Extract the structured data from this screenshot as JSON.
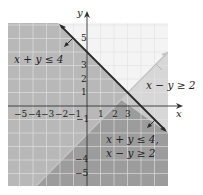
{
  "graph": {
    "axes": {
      "x_label": "x",
      "y_label": "y",
      "x_tick_labels": [
        "−5",
        "−4",
        "−3",
        "−2",
        "−1",
        "1",
        "2",
        "3"
      ],
      "y_tick_labels": [
        "5",
        "3",
        "2",
        "1",
        "−1",
        "−4",
        "−5"
      ]
    },
    "labels": {
      "region1": "x + y ≤ 4",
      "region2": "x − y ≥ 2",
      "solution_line1": "x + y ≤ 4,",
      "solution_line2": "x − y ≥ 2"
    },
    "lines": [
      {
        "equation": "x + y = 4",
        "style": "solid-dark"
      },
      {
        "equation": "x − y = 2",
        "style": "solid-light"
      }
    ],
    "colors": {
      "region1_shade": "#b3b3b3",
      "region2_shade": "#c9c9c9",
      "overlap_shade": "#9a9a9a",
      "grid": "#e6e6e6",
      "boundary_dark": "#2a2a2a",
      "boundary_light": "#bdbdbd"
    }
  }
}
